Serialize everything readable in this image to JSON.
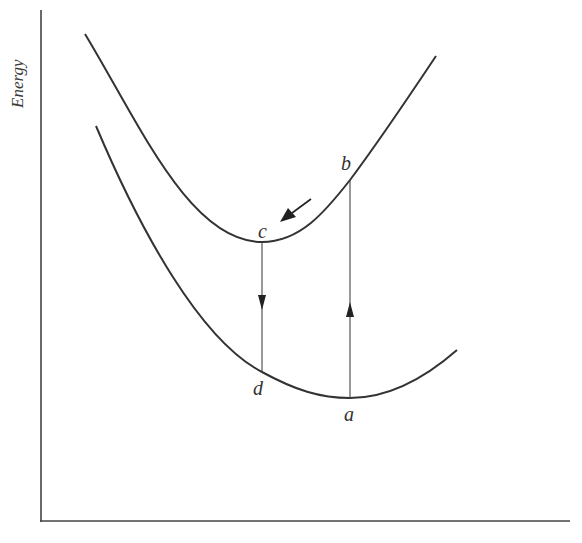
{
  "diagram": {
    "y_axis_label": "Energy",
    "x_axis_label": "",
    "points": {
      "a": {
        "label": "a",
        "x": 350,
        "y": 398
      },
      "b": {
        "label": "b",
        "x": 350,
        "y": 180
      },
      "c": {
        "label": "c",
        "x": 262,
        "y": 242
      },
      "d": {
        "label": "d",
        "x": 262,
        "y": 372
      }
    },
    "curves": [
      {
        "name": "upper-potential-curve",
        "description": "excited state"
      },
      {
        "name": "lower-potential-curve",
        "description": "ground state"
      }
    ],
    "transitions": [
      {
        "from": "a",
        "to": "b",
        "direction": "up"
      },
      {
        "from": "b",
        "to": "c",
        "direction": "along curve"
      },
      {
        "from": "c",
        "to": "d",
        "direction": "down"
      }
    ],
    "colors": {
      "line": "#333333",
      "text": "#333333"
    }
  }
}
